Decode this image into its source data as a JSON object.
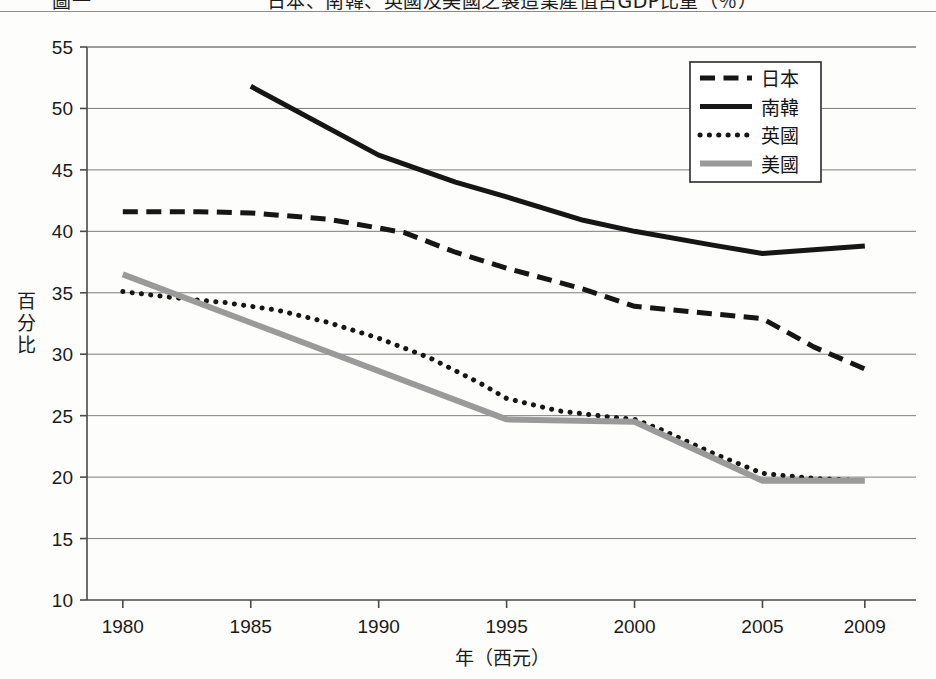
{
  "caption": {
    "text": "圖一　　　　　　　　　日本、南韓、英國及美國之製造業產值占GDP比重（％）",
    "visible_note": "partially-cropped-top"
  },
  "chart_data": {
    "type": "line",
    "title": "",
    "xlabel": "年（西元）",
    "ylabel": "百分比",
    "xlim": [
      1978.6,
      2011.0
    ],
    "ylim": [
      10,
      55
    ],
    "ytick_step": 5,
    "yticks": [
      10,
      15,
      20,
      25,
      30,
      35,
      40,
      45,
      50,
      55
    ],
    "xticks": [
      1980,
      1985,
      1990,
      1995,
      2000,
      2005,
      2009
    ],
    "grid": "horizontal",
    "legend_position": "top-right-inside",
    "series": [
      {
        "name": "日本",
        "style": "dashed",
        "color": "#161616",
        "width": 5,
        "x": [
          1980,
          1983,
          1985,
          1988,
          1991,
          1993,
          1995,
          1998,
          2000,
          2003,
          2005,
          2007,
          2009
        ],
        "values": [
          41.6,
          41.6,
          41.5,
          41.0,
          39.9,
          38.3,
          37.0,
          35.3,
          33.9,
          33.3,
          32.9,
          30.6,
          28.8
        ]
      },
      {
        "name": "南韓",
        "style": "solid",
        "color": "#161616",
        "width": 5,
        "x": [
          1985,
          1990,
          1993,
          1995,
          1998,
          2000,
          2003,
          2005,
          2007,
          2009
        ],
        "values": [
          51.8,
          46.2,
          44.0,
          42.8,
          40.9,
          40.0,
          38.9,
          38.2,
          38.5,
          38.8
        ]
      },
      {
        "name": "英國",
        "style": "dotted",
        "color": "#161616",
        "width": 5,
        "x": [
          1980,
          1982,
          1984,
          1986,
          1988,
          1990,
          1992,
          1994,
          1995,
          1997,
          1999,
          2000,
          2001,
          2003,
          2005,
          2007,
          2009
        ],
        "values": [
          35.1,
          34.6,
          34.2,
          33.6,
          32.6,
          31.3,
          29.7,
          27.6,
          26.4,
          25.4,
          24.9,
          24.7,
          23.9,
          22.0,
          20.3,
          19.9,
          19.7
        ]
      },
      {
        "name": "美國",
        "style": "solid",
        "color": "#9a9a9a",
        "width": 6,
        "x": [
          1980,
          1995,
          2000,
          2005,
          2009
        ],
        "values": [
          36.5,
          24.7,
          24.5,
          19.7,
          19.7
        ]
      }
    ]
  },
  "legend": {
    "entries": [
      {
        "label": "日本",
        "swatch": "dashed-black"
      },
      {
        "label": "南韓",
        "swatch": "solid-black"
      },
      {
        "label": "英國",
        "swatch": "dotted-black"
      },
      {
        "label": "美國",
        "swatch": "solid-gray"
      }
    ]
  },
  "colors": {
    "axis": "#4a4a4a",
    "grid": "#7d7d7d",
    "black_series": "#161616",
    "gray_series": "#9a9a9a",
    "text": "#1a1a1a",
    "background": "#fdfdfc"
  }
}
